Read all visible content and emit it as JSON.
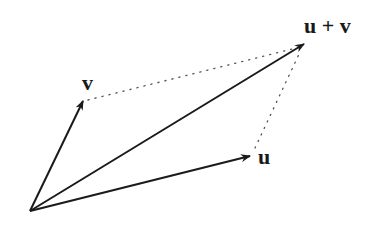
{
  "diagram": {
    "origin": [
      30,
      211
    ],
    "vectors": [
      {
        "id": "v",
        "label": "v",
        "tip": [
          83,
          101
        ],
        "label_pos": [
          82,
          88
        ]
      },
      {
        "id": "u",
        "label": "u",
        "tip": [
          250,
          156
        ],
        "label_pos": [
          258,
          165
        ]
      },
      {
        "id": "u_plus_v",
        "label": "u + v",
        "tip": [
          304,
          44
        ],
        "label_pos": [
          304,
          32
        ]
      }
    ],
    "dotted_edges": [
      {
        "from": "v",
        "to": "u_plus_v"
      },
      {
        "from": "u",
        "to": "u_plus_v"
      }
    ],
    "colors": {
      "line": "#1a1a1a",
      "dotted": "#555555",
      "background": "#ffffff"
    }
  }
}
